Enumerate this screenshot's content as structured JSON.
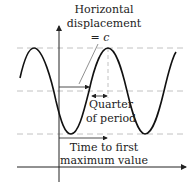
{
  "diagram": {
    "type": "sinusoid-phase-shift",
    "labels": {
      "horizontal_displacement_line1": "Horizontal",
      "horizontal_displacement_line2": "displacement",
      "horizontal_displacement_line3": "= c",
      "quarter_line1": "Quarter",
      "quarter_line2": "of period",
      "time_line1": "Time to first",
      "time_line2": "maximum value"
    },
    "colors": {
      "curve": "#111111",
      "axis": "#222222",
      "dashed": "#bbbbbb",
      "text": "#222222"
    }
  }
}
